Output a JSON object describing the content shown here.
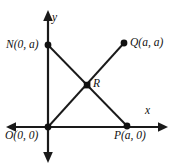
{
  "figure": {
    "type": "coordinate-geometry-diagram",
    "background_color": "#ffffff",
    "stroke_color": "#1a1a1a",
    "axes": {
      "x_axis_label": "x",
      "y_axis_label": "y",
      "x_axis_label_pos": {
        "x": 145,
        "y": 105
      },
      "y_axis_label_pos": {
        "x": 52,
        "y": 12
      }
    },
    "points": [
      {
        "id": "N",
        "label": "N(0, a)",
        "marker": "dot",
        "px": 48,
        "py": 45,
        "label_x": 6,
        "label_y": 39,
        "label_align": "right"
      },
      {
        "id": "Q",
        "label": "Q(a, a)",
        "marker": "dot",
        "px": 124,
        "py": 43,
        "label_x": 130,
        "label_y": 37,
        "label_align": "left"
      },
      {
        "id": "R",
        "label": "R",
        "marker": "square",
        "px": 87,
        "py": 85,
        "label_x": 93,
        "label_y": 78,
        "label_align": "left"
      },
      {
        "id": "O",
        "label": "O(0, 0)",
        "marker": "dot",
        "px": 48,
        "py": 127,
        "label_x": 5,
        "label_y": 130,
        "label_align": "left"
      },
      {
        "id": "P",
        "label": "P(a, 0)",
        "marker": "dot",
        "px": 127,
        "py": 126,
        "label_x": 114,
        "label_y": 130,
        "label_align": "left"
      }
    ],
    "segments": [
      {
        "id": "NP",
        "from": "N",
        "to": "P"
      },
      {
        "id": "OQ",
        "from": "O",
        "to": "Q"
      }
    ]
  }
}
